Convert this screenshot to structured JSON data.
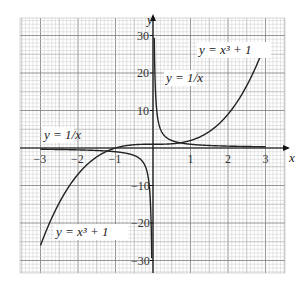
{
  "chart_data": {
    "type": "line",
    "title": "",
    "xlabel": "x",
    "ylabel": "y",
    "xlim": [
      -3.5,
      3.5
    ],
    "ylim": [
      -32,
      32
    ],
    "grid": true,
    "x_ticks": [
      "-3",
      "-2",
      "-1",
      "1",
      "2",
      "3"
    ],
    "y_ticks": [
      "30",
      "20",
      "10",
      "-10",
      "-20",
      "-30"
    ],
    "series": [
      {
        "name": "y = x^3 + 1",
        "function": "x^3+1",
        "domain": [
          -3,
          3
        ]
      },
      {
        "name": "y = 1/x",
        "function": "1/x",
        "domain": [
          -3,
          3
        ]
      }
    ],
    "annotations": [
      {
        "text": "y = x³ + 1",
        "position": "upper right"
      },
      {
        "text": "y = 1/x",
        "position": "upper middle near y-axis"
      },
      {
        "text": "y = 1/x",
        "position": "left near x-axis"
      },
      {
        "text": "y = x³ + 1",
        "position": "lower left"
      }
    ]
  },
  "labels": {
    "cubic_upper": "y = x³ + 1",
    "cubic_lower": "y = x³ + 1",
    "recip_upper": "y = 1/x",
    "recip_left": "y = 1/x",
    "x_axis": "x",
    "y_axis": "y"
  }
}
